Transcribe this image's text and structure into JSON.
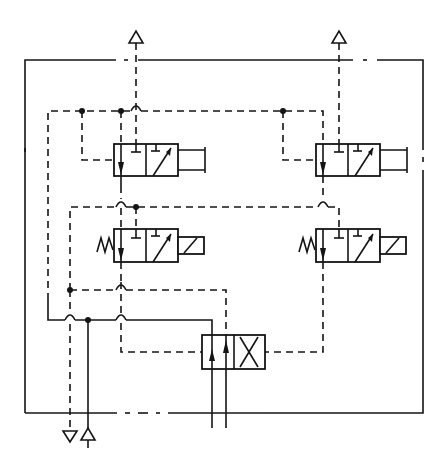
{
  "diagram": {
    "title": "",
    "type": "pneumatic control circuit schematic",
    "colors": {
      "line": "#141414",
      "background": "#ffffff"
    },
    "boundary": {
      "style": "dash-dot",
      "label": ""
    },
    "components": [
      {
        "id": "valve-upper-left",
        "kind": "3/2 way valve",
        "actuation": "push-button",
        "return": "pilot"
      },
      {
        "id": "valve-upper-right",
        "kind": "3/2 way valve",
        "actuation": "push-button",
        "return": "pilot"
      },
      {
        "id": "valve-lower-left",
        "kind": "3/2 way valve",
        "actuation": "solenoid",
        "return": "spring"
      },
      {
        "id": "valve-lower-right",
        "kind": "3/2 way valve",
        "actuation": "solenoid",
        "return": "spring"
      },
      {
        "id": "valve-main",
        "kind": "4/2 way valve",
        "actuation": "pilot both sides"
      }
    ],
    "ports": [
      {
        "id": "exhaust-top-left",
        "symbol": "triangle-up-open",
        "line": "dashed"
      },
      {
        "id": "exhaust-top-right",
        "symbol": "triangle-up-open",
        "line": "dashed"
      },
      {
        "id": "exhaust-bottom",
        "symbol": "triangle-down-open",
        "line": "dashed"
      },
      {
        "id": "supply-bottom",
        "symbol": "triangle-up-open",
        "line": "solid"
      },
      {
        "id": "work-ports",
        "count": 2,
        "line": "solid"
      }
    ],
    "line_legend": {
      "solid": "main / supply line",
      "dashed": "pilot / control line"
    }
  }
}
